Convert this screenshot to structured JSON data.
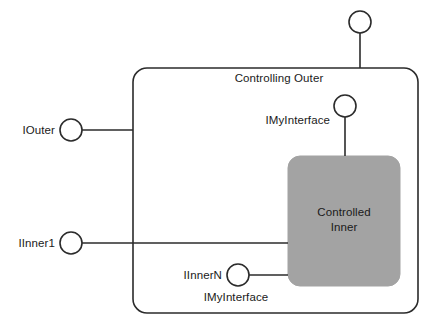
{
  "diagram": {
    "type": "com-aggregation-containment",
    "canvas": {
      "width": 433,
      "height": 324,
      "background": "#ffffff"
    },
    "colors": {
      "stroke": "#2b2b2b",
      "text": "#1a1a1a",
      "inner_fill": "#a3a3a3",
      "inner_stroke": "#a3a3a3",
      "outer_fill": "#ffffff"
    },
    "outer_component": {
      "label": "Controlling Outer",
      "label_x": 279,
      "label_y": 72,
      "box": {
        "x": 133,
        "y": 68,
        "width": 285,
        "height": 245,
        "radius": 14
      }
    },
    "inner_component": {
      "label_line1": "Controlled",
      "label_line2": "Inner",
      "label_x": 344,
      "label_y": 206,
      "box": {
        "x": 288,
        "y": 156,
        "width": 112,
        "height": 130,
        "radius": 12
      }
    },
    "interfaces": [
      {
        "name": "outer-top-interface",
        "label": "",
        "circle": {
          "cx": 360,
          "cy": 22,
          "r": 11
        },
        "lead": {
          "x1": 360,
          "y1": 33,
          "x2": 360,
          "y2": 68
        }
      },
      {
        "name": "iouter-interface",
        "label": "IOuter",
        "label_x": 55,
        "label_y": 124,
        "label_align": "right",
        "circle": {
          "cx": 71,
          "cy": 130,
          "r": 11
        },
        "lead": {
          "x1": 82,
          "y1": 130,
          "x2": 133,
          "y2": 130
        }
      },
      {
        "name": "imyinterface-inner-top",
        "label": "IMyInterface",
        "label_x": 330,
        "label_y": 114,
        "label_align": "right",
        "circle": {
          "cx": 345,
          "cy": 106,
          "r": 11
        },
        "lead": {
          "x1": 345,
          "y1": 117,
          "x2": 345,
          "y2": 156
        }
      },
      {
        "name": "iinner1-interface",
        "label": "IInner1",
        "label_x": 55,
        "label_y": 237,
        "label_align": "right",
        "circle": {
          "cx": 71,
          "cy": 243,
          "r": 11
        },
        "lead": {
          "x1": 82,
          "y1": 243,
          "x2": 288,
          "y2": 243
        }
      },
      {
        "name": "iinnern-interface",
        "label": "IInnerN",
        "label_x": 222,
        "label_y": 269,
        "label_align": "right",
        "sublabel": "IMyInterface",
        "sublabel_x": 236,
        "sublabel_y": 291,
        "circle": {
          "cx": 238,
          "cy": 275,
          "r": 11
        },
        "lead": {
          "x1": 249,
          "y1": 275,
          "x2": 288,
          "y2": 275
        }
      }
    ]
  }
}
